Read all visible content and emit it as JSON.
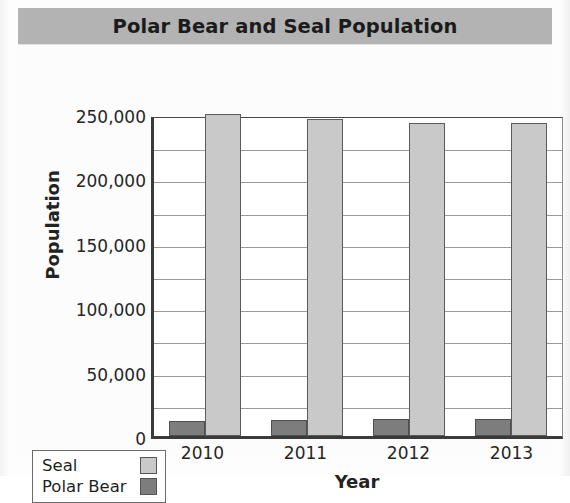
{
  "title": "Polar Bear and Seal Population",
  "legend": {
    "position": "bottom-left",
    "entries": [
      {
        "label": "Seal",
        "color": "#c9c9c9"
      },
      {
        "label": "Polar Bear",
        "color": "#7d7d7d"
      }
    ]
  },
  "axes": {
    "xlabel": "Year",
    "ylabel": "Population",
    "yticks": [
      "250,000",
      "200,000",
      "150,000",
      "100,000",
      "50,000",
      "0"
    ],
    "xticks": [
      "2010",
      "2011",
      "2012",
      "2013"
    ]
  },
  "chart_data": {
    "type": "bar",
    "title": "Polar Bear and Seal Population",
    "xlabel": "Year",
    "ylabel": "Population",
    "categories": [
      "2010",
      "2011",
      "2012",
      "2013"
    ],
    "series": [
      {
        "name": "Polar Bear",
        "color": "#7d7d7d",
        "values": [
          12000,
          12500,
          13500,
          13500
        ]
      },
      {
        "name": "Seal",
        "color": "#c9c9c9",
        "values": [
          250000,
          246000,
          243000,
          243000
        ]
      }
    ],
    "ylim": [
      0,
      250000
    ],
    "ytick_step": 50000,
    "gridline_step": 25000,
    "grid": true,
    "legend_position": "bottom-left"
  }
}
